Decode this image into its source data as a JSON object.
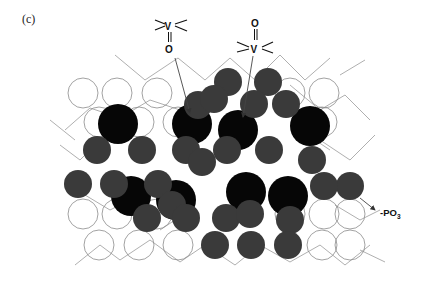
{
  "figure": {
    "panel_label": "(c)",
    "colors": {
      "oxygen_outline": "#8a8a8a",
      "bond_line": "#8a8a8a",
      "vanadium_black": "#060606",
      "phosphorus_gray": "#3a3a3a",
      "arrow": "#444444",
      "text": "#111111"
    },
    "annotations": {
      "vo_down": {
        "v": "V",
        "o": "O",
        "description": "V=O pointing down"
      },
      "vo_up": {
        "v": "V",
        "o": "O",
        "description": "V=O pointing up"
      },
      "po3": {
        "text": "-PO",
        "subscript": "3"
      }
    },
    "open_circles": [
      [
        83,
        93
      ],
      [
        117,
        93
      ],
      [
        157,
        93
      ],
      [
        290,
        93
      ],
      [
        324,
        93
      ],
      [
        99,
        122
      ],
      [
        139,
        122
      ],
      [
        178,
        122
      ],
      [
        322,
        122
      ],
      [
        83,
        214
      ],
      [
        117,
        214
      ],
      [
        157,
        214
      ],
      [
        290,
        214
      ],
      [
        324,
        214
      ],
      [
        350,
        214
      ],
      [
        99,
        245
      ],
      [
        139,
        245
      ],
      [
        178,
        245
      ],
      [
        322,
        245
      ],
      [
        350,
        245
      ]
    ],
    "black_circles": [
      [
        118,
        124
      ],
      [
        192,
        124
      ],
      [
        238,
        130
      ],
      [
        310,
        126
      ],
      [
        131,
        196
      ],
      [
        176,
        200
      ],
      [
        246,
        192
      ],
      [
        288,
        196
      ]
    ],
    "gray_circles": [
      [
        228,
        82
      ],
      [
        268,
        82
      ],
      [
        198,
        105
      ],
      [
        214,
        99
      ],
      [
        254,
        104
      ],
      [
        286,
        104
      ],
      [
        97,
        150
      ],
      [
        142,
        150
      ],
      [
        186,
        150
      ],
      [
        227,
        150
      ],
      [
        269,
        150
      ],
      [
        78,
        184
      ],
      [
        114,
        184
      ],
      [
        158,
        184
      ],
      [
        172,
        205
      ],
      [
        202,
        162
      ],
      [
        312,
        160
      ],
      [
        350,
        186
      ],
      [
        147,
        218
      ],
      [
        186,
        218
      ],
      [
        226,
        218
      ],
      [
        250,
        214
      ],
      [
        290,
        220
      ],
      [
        215,
        245
      ],
      [
        251,
        245
      ],
      [
        288,
        245
      ],
      [
        324,
        186
      ]
    ]
  }
}
